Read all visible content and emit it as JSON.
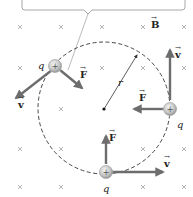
{
  "callout": {
    "text": ""
  },
  "field": {
    "label": "B",
    "symbol": "×",
    "direction": "into-page"
  },
  "radius_label": "r",
  "charges": [
    {
      "name": "top-left",
      "label": "q",
      "sign": "+",
      "force_label": "F",
      "velocity_label": "v"
    },
    {
      "name": "right",
      "label": "q",
      "sign": "+",
      "force_label": "F",
      "velocity_label": "v"
    },
    {
      "name": "bottom",
      "label": "q",
      "sign": "+",
      "force_label": "F",
      "velocity_label": "v"
    }
  ],
  "colors": {
    "vector": "#6d6d6d",
    "path": "#333333",
    "field_marker": "#b5b5b5",
    "charge_fill": "#d9d9d9",
    "callout_border": "#a8a8a8"
  }
}
